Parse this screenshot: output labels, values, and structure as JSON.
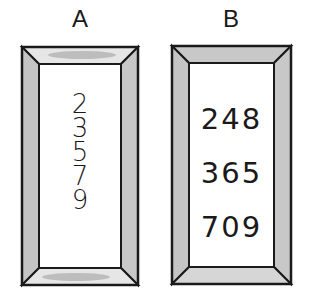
{
  "frames": [
    {
      "label": "A",
      "numbers": [
        "2",
        "3",
        "5",
        "7",
        "9"
      ]
    },
    {
      "label": "B",
      "numbers": [
        "248",
        "365",
        "709"
      ]
    }
  ],
  "colors": {
    "frame_outline": "#1a1a1a",
    "bevel_shade": "#b8b8b8",
    "bevel_light": "#e4e4e4",
    "background": "#ffffff"
  }
}
